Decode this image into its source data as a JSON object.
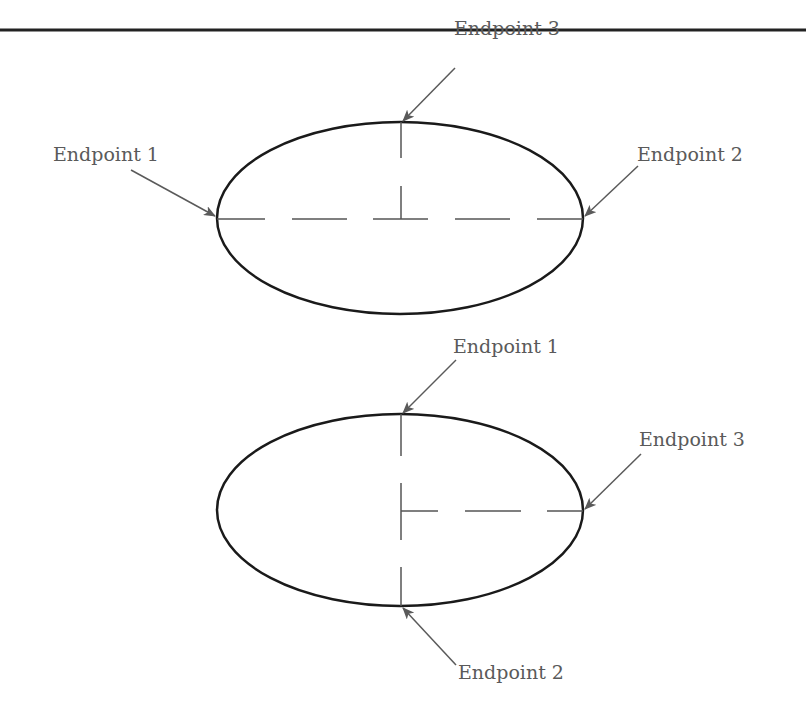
{
  "figure": {
    "top_rule": {
      "y": 30,
      "color": "#222222"
    },
    "colors": {
      "outline": "#1a1a1a",
      "dash": "#555555",
      "arrow": "#5a5a5a",
      "text": "#5a5a5a"
    },
    "ellipses": [
      {
        "id": "top",
        "cx": 400,
        "cy": 218,
        "rx": 183,
        "ry": 96,
        "labels": [
          {
            "text": "Endpoint 1",
            "x": 53,
            "y": 161,
            "target": [
              217,
              218
            ],
            "from": [
              131,
              170
            ]
          },
          {
            "text": "Endpoint 2",
            "x": 637,
            "y": 161,
            "target": [
              583,
              218
            ],
            "from": [
              638,
              166
            ]
          },
          {
            "text": "Endpoint 3",
            "x": 454,
            "y": 35,
            "target": [
              401,
              122
            ],
            "from": [
              455,
              68
            ]
          }
        ]
      },
      {
        "id": "bottom",
        "cx": 400,
        "cy": 510,
        "rx": 183,
        "ry": 96,
        "labels": [
          {
            "text": "Endpoint 1",
            "x": 453,
            "y": 353,
            "target": [
              401,
              414
            ],
            "from": [
              456,
              360
            ]
          },
          {
            "text": "Endpoint 3",
            "x": 639,
            "y": 446,
            "target": [
              583,
              510
            ],
            "from": [
              641,
              454
            ]
          },
          {
            "text": "Endpoint 2",
            "x": 458,
            "y": 679,
            "target": [
              401,
              606
            ],
            "from": [
              456,
              665
            ]
          }
        ]
      }
    ]
  },
  "labels": {
    "top_endpoint_1": "Endpoint 1",
    "top_endpoint_2": "Endpoint 2",
    "top_endpoint_3": "Endpoint 3",
    "bottom_endpoint_1": "Endpoint 1",
    "bottom_endpoint_2": "Endpoint 2",
    "bottom_endpoint_3": "Endpoint 3"
  }
}
